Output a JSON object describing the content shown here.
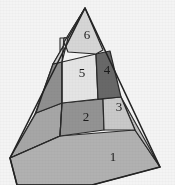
{
  "figure": {
    "type": "pyramid",
    "background_color": "#ffffff",
    "outline_color": "#2b2b2b",
    "label_color": "#1c1c1c",
    "tier_count": 3,
    "segment_count": 6
  },
  "geometry": {
    "apex": [
      85,
      8
    ],
    "base_left": [
      10,
      158
    ],
    "base_right": [
      160,
      167
    ],
    "base_front": [
      92,
      185
    ],
    "front_edge_top": [
      85,
      8
    ],
    "tier_breaks_y": [
      52,
      97,
      136
    ]
  },
  "segments": [
    {
      "id": "segment-1",
      "label": "1",
      "tier": "base",
      "face": "right",
      "fill": "#b9b9b9",
      "label_x": 113,
      "label_y": 158
    },
    {
      "id": "segment-2",
      "label": "2",
      "tier": "middle",
      "face": "right",
      "fill": "#9a9a9a",
      "label_x": 86,
      "label_y": 117
    },
    {
      "id": "segment-3",
      "label": "3",
      "tier": "middle",
      "face": "right",
      "fill": "#d2d2d2",
      "label_x": 120,
      "label_y": 107
    },
    {
      "id": "segment-4",
      "label": "4",
      "tier": "top",
      "face": "right",
      "fill": "#6d6d6d",
      "label_x": 108,
      "label_y": 70
    },
    {
      "id": "segment-5",
      "label": "5",
      "tier": "top",
      "face": "right",
      "fill": "#efefef",
      "label_x": 83,
      "label_y": 73
    },
    {
      "id": "segment-6",
      "label": "6",
      "tier": "apex",
      "face": "right",
      "fill": "#e0e0e0",
      "label_x": 87,
      "label_y": 35
    }
  ],
  "side_faces": [
    {
      "id": "side-face-base",
      "tier": "base",
      "face": "left",
      "fill": "#b6b6b6"
    },
    {
      "id": "side-face-middle",
      "tier": "middle",
      "face": "left",
      "fill": "#8f8f8f"
    },
    {
      "id": "side-face-top",
      "tier": "top",
      "face": "left",
      "fill": "#e4e4e4"
    },
    {
      "id": "side-face-apex",
      "tier": "apex",
      "face": "left",
      "fill": "#dcdcdc"
    }
  ]
}
